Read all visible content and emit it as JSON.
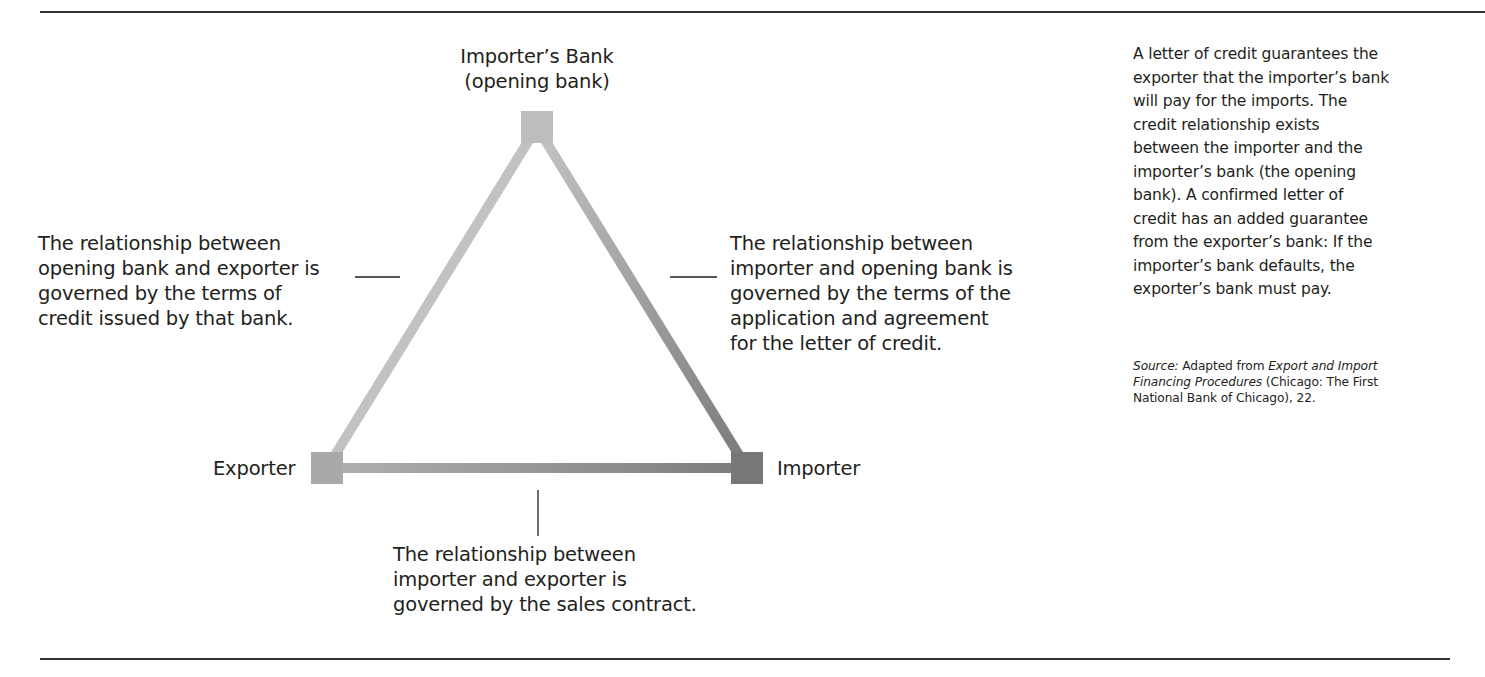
{
  "diagram": {
    "type": "triangle-relationship",
    "nodes": {
      "top": {
        "label_line1": "Importer’s Bank",
        "label_line2": "(opening bank)",
        "color": "#bdbdbd"
      },
      "left": {
        "label": "Exporter",
        "color": "#aaaaaa"
      },
      "right": {
        "label": "Importer",
        "color": "#777777"
      }
    },
    "edges": {
      "left": {
        "from": "Importer’s Bank",
        "to": "Exporter"
      },
      "right": {
        "from": "Importer’s Bank",
        "to": "Importer"
      },
      "bottom": {
        "from": "Exporter",
        "to": "Importer"
      }
    },
    "annotations": {
      "left": {
        "lines": [
          "The relationship between",
          "opening bank and exporter is",
          "governed by the terms of",
          "credit issued by that bank."
        ]
      },
      "right": {
        "lines": [
          "The relationship between",
          "importer and opening bank is",
          "governed by the terms of the",
          "application and agreement",
          "for the letter of credit."
        ]
      },
      "bottom": {
        "lines": [
          "The relationship between",
          "importer and exporter is",
          "governed by the sales contract."
        ]
      }
    }
  },
  "sidebar": {
    "lines": [
      "A letter of credit guarantees the",
      "exporter that the importer’s bank",
      "will pay for the imports. The",
      "credit relationship exists",
      "between the importer and the",
      "importer’s bank (the opening",
      "bank). A confirmed letter of",
      "credit has an added guarantee",
      "from the exporter’s bank: If the",
      "importer’s bank defaults, the",
      "exporter’s bank must pay."
    ],
    "source": {
      "label": "Source:",
      "prefix": " Adapted from ",
      "title_part1": "Export and Import",
      "title_part2": "Financing Procedures",
      "suffix_line2": " (Chicago: The First",
      "line3": "National Bank of Chicago), 22."
    }
  }
}
